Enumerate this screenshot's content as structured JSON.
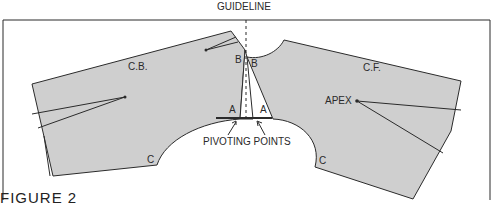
{
  "figure": {
    "guideline_label": "GUIDELINE",
    "caption": "FIGURE 2",
    "labels": {
      "cb": "C.B.",
      "cf": "C.F.",
      "apex": "APEX",
      "b_left": "B",
      "b_right": "B",
      "a_left": "A",
      "a_right": "A",
      "c_left": "C",
      "c_right": "C",
      "pivoting_points": "PIVOTING POINTS"
    },
    "colors": {
      "fill": "#cfcfcf",
      "stroke": "#2b2b2b",
      "background": "#ffffff"
    }
  }
}
